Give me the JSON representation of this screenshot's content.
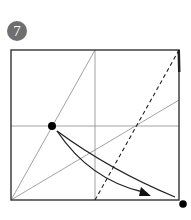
{
  "step": {
    "number": "7",
    "badge_color": "#6f6f6f"
  },
  "diagram": {
    "type": "origami-fold-step",
    "square": {
      "x1": 11,
      "y1": 50,
      "x2": 179,
      "y2": 200
    },
    "crease_lines": [
      {
        "name": "vertical-center",
        "x1": 95,
        "y1": 50,
        "x2": 95,
        "y2": 200
      },
      {
        "name": "horizontal-center",
        "x1": 11,
        "y1": 126,
        "x2": 179,
        "y2": 126
      },
      {
        "name": "steep-diagonal",
        "x1": 11,
        "y1": 200,
        "x2": 95,
        "y2": 50
      },
      {
        "name": "shallow-diagonal",
        "x1": 11,
        "y1": 200,
        "x2": 179,
        "y2": 100
      }
    ],
    "fold_line": {
      "name": "valley-fold-dashed",
      "x1": 95,
      "y1": 200,
      "x2": 179,
      "y2": 50
    },
    "points": [
      {
        "name": "reference-point-left",
        "cx": 52,
        "cy": 126
      },
      {
        "name": "target-point-bottom-right",
        "cx": 183,
        "cy": 204
      }
    ],
    "arrows": [
      {
        "name": "fold-arrow",
        "from": [
          57,
          131
        ],
        "to": [
          151,
          196
        ]
      }
    ],
    "colors": {
      "border": "#333333",
      "crease": "#8a8a8a",
      "fold": "#222222",
      "dot": "#000000"
    }
  }
}
